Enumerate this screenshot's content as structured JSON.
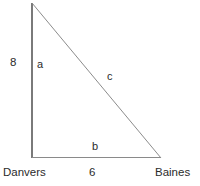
{
  "figure": {
    "type": "right-triangle-diagram",
    "background_color": "#ffffff",
    "stroke_color": "#6e6e6e",
    "text_color": "#2b2b2b"
  },
  "vertices": {
    "apex": {
      "x": 32,
      "y": 3
    },
    "bottom_left": {
      "x": 32,
      "y": 158
    },
    "bottom_right": {
      "x": 161,
      "y": 158
    }
  },
  "labels": {
    "leg_vertical_length": "8",
    "leg_vertical_name": "a",
    "hypotenuse_name": "c",
    "leg_horizontal_name": "b",
    "leg_horizontal_length": "6",
    "city_left": "Danvers",
    "city_right": "Baines"
  }
}
